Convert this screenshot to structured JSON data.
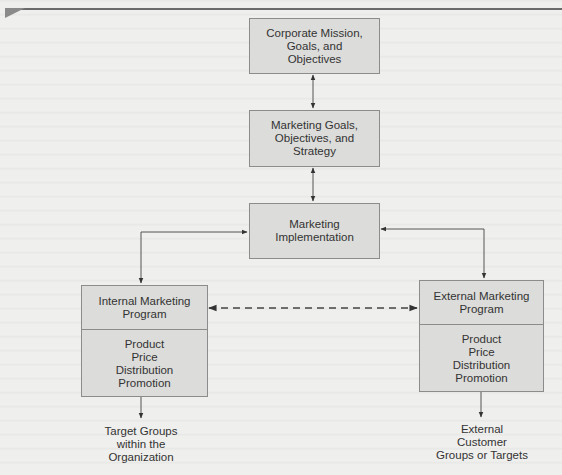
{
  "diagram": {
    "nodes": {
      "corporate": {
        "lines": [
          "Corporate Mission,",
          "Goals, and",
          "Objectives"
        ]
      },
      "marketing_goals": {
        "lines": [
          "Marketing Goals,",
          "Objectives, and",
          "Strategy"
        ]
      },
      "implementation": {
        "lines": [
          "Marketing",
          "Implementation"
        ]
      },
      "internal_program": {
        "title": [
          "Internal Marketing",
          "Program"
        ],
        "items": [
          "Product",
          "Price",
          "Distribution",
          "Promotion"
        ]
      },
      "external_program": {
        "title": [
          "External Marketing",
          "Program"
        ],
        "items": [
          "Product",
          "Price",
          "Distribution",
          "Promotion"
        ]
      },
      "internal_targets": {
        "lines": [
          "Target Groups",
          "within the",
          "Organization"
        ]
      },
      "external_targets": {
        "lines": [
          "External",
          "Customer",
          "Groups or Targets"
        ]
      }
    },
    "edges": [
      {
        "from": "corporate",
        "to": "marketing_goals",
        "style": "solid",
        "direction": "both"
      },
      {
        "from": "marketing_goals",
        "to": "implementation",
        "style": "solid",
        "direction": "both"
      },
      {
        "from": "implementation",
        "to": "internal_program",
        "style": "solid",
        "direction": "both"
      },
      {
        "from": "implementation",
        "to": "external_program",
        "style": "solid",
        "direction": "both"
      },
      {
        "from": "internal_program",
        "to": "external_program",
        "style": "dashed",
        "direction": "both"
      },
      {
        "from": "internal_program",
        "to": "internal_targets",
        "style": "solid",
        "direction": "forward"
      },
      {
        "from": "external_program",
        "to": "external_targets",
        "style": "solid",
        "direction": "forward"
      }
    ],
    "colors": {
      "box_fill": "#dcdcda",
      "box_border": "#8c8c8c",
      "line": "#555555",
      "text": "#333333",
      "background": "#efefed"
    }
  }
}
